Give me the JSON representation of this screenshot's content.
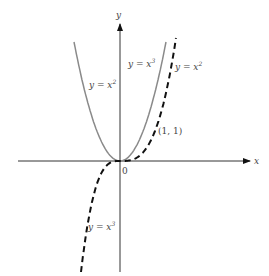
{
  "chart_data": {
    "type": "line",
    "title": "",
    "xlabel": "x",
    "ylabel": "y",
    "origin_label": "0",
    "grid": false,
    "series": [
      {
        "name": "y = x^2",
        "function": "x^2",
        "style": "solid",
        "color": "#8a8a8a",
        "x_range": [
          -1.6,
          1.6
        ]
      },
      {
        "name": "y = x^3",
        "function": "x^3",
        "style": "dashed",
        "color": "#111111",
        "x_range": [
          -1.4,
          1.9
        ]
      }
    ],
    "annotations": [
      {
        "text": "(1, 1)",
        "x": 1,
        "y": 1
      }
    ],
    "labels": {
      "parabola_left": {
        "pre": "y = x",
        "exp": "2"
      },
      "parabola_right": {
        "pre": "y = x",
        "exp": "3"
      },
      "cubic_upper": {
        "pre": "y = x",
        "exp": "2"
      },
      "cubic_lower": {
        "pre": "y = x",
        "exp": "3"
      }
    }
  }
}
